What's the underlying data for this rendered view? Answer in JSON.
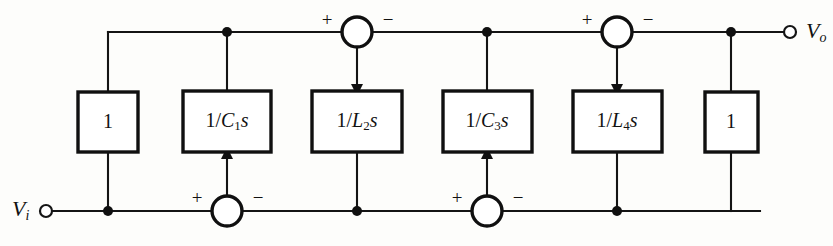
{
  "diagram": {
    "type": "signal-flow-block-diagram",
    "canvas": {
      "width": 833,
      "height": 246
    },
    "colors": {
      "line": "#141414",
      "block_stroke": "#101010",
      "background": "#fdfdfb",
      "text": "#111111"
    },
    "ports": [
      {
        "id": "input-port",
        "label_main": "V",
        "label_sub": "i",
        "x": 12,
        "y": 211,
        "terminal_x": 46,
        "terminal_y": 211,
        "terminal_r": 6
      },
      {
        "id": "output-port",
        "label_main": "V",
        "label_sub": "o",
        "x": 806,
        "y": 33,
        "terminal_x": 790,
        "terminal_y": 32,
        "terminal_r": 6
      }
    ],
    "blocks": [
      {
        "id": "block-1-left",
        "label_main": "1",
        "label_num": "1",
        "label_den": "",
        "label_sub": "",
        "label_tail": "",
        "x": 78,
        "y": 92,
        "w": 60,
        "h": 60,
        "cx": 108,
        "cy": 122
      },
      {
        "id": "block-c1s",
        "label_main": "1/C1s",
        "label_num": "1/",
        "label_den": "C",
        "label_sub": "1",
        "label_tail": "s",
        "x": 183,
        "y": 91,
        "w": 88,
        "h": 61,
        "cx": 227,
        "cy": 121
      },
      {
        "id": "block-l2s",
        "label_main": "1/L2s",
        "label_num": "1/",
        "label_den": "L",
        "label_sub": "2",
        "label_tail": "s",
        "x": 312,
        "y": 91,
        "w": 90,
        "h": 61,
        "cx": 357,
        "cy": 121
      },
      {
        "id": "block-c3s",
        "label_main": "1/C3s",
        "label_num": "1/",
        "label_den": "C",
        "label_sub": "3",
        "label_tail": "s",
        "x": 443,
        "y": 91,
        "w": 89,
        "h": 61,
        "cx": 487,
        "cy": 121
      },
      {
        "id": "block-l4s",
        "label_main": "1/L4s",
        "label_num": "1/",
        "label_den": "L",
        "label_sub": "4",
        "label_tail": "s",
        "x": 573,
        "y": 91,
        "w": 89,
        "h": 61,
        "cx": 617,
        "cy": 121
      },
      {
        "id": "block-1-right",
        "label_main": "1",
        "label_num": "1",
        "label_den": "",
        "label_sub": "",
        "label_tail": "",
        "x": 705,
        "y": 92,
        "w": 53,
        "h": 60,
        "cx": 731,
        "cy": 122
      }
    ],
    "summing_junctions": [
      {
        "id": "sum-top-left",
        "cx": 357,
        "cy": 32,
        "r": 15,
        "left_sign": "+",
        "right_sign": "−",
        "left_sign_x": 327,
        "right_sign_x": 388,
        "sign_y": 22,
        "output_direction": "down"
      },
      {
        "id": "sum-top-right",
        "cx": 617,
        "cy": 32,
        "r": 15,
        "left_sign": "+",
        "right_sign": "−",
        "left_sign_x": 587,
        "right_sign_x": 648,
        "sign_y": 22,
        "output_direction": "down"
      },
      {
        "id": "sum-bottom-left",
        "cx": 227,
        "cy": 211,
        "r": 15,
        "left_sign": "+",
        "right_sign": "−",
        "left_sign_x": 197,
        "right_sign_x": 258,
        "sign_y": 200,
        "output_direction": "up"
      },
      {
        "id": "sum-bottom-right",
        "cx": 487,
        "cy": 211,
        "r": 15,
        "left_sign": "+",
        "right_sign": "−",
        "left_sign_x": 457,
        "right_sign_x": 518,
        "sign_y": 200,
        "output_direction": "up"
      }
    ],
    "junction_dots": [
      {
        "id": "dot-top-c1s",
        "cx": 227,
        "cy": 32,
        "r": 5
      },
      {
        "id": "dot-top-c3s",
        "cx": 487,
        "cy": 32,
        "r": 5
      },
      {
        "id": "dot-top-output",
        "cx": 731,
        "cy": 32,
        "r": 5
      },
      {
        "id": "dot-bottom-input",
        "cx": 108,
        "cy": 211,
        "r": 5
      },
      {
        "id": "dot-bottom-l2s",
        "cx": 357,
        "cy": 211,
        "r": 5
      },
      {
        "id": "dot-bottom-l4s",
        "cx": 617,
        "cy": 211,
        "r": 5
      }
    ],
    "wires": [
      {
        "id": "wire-top-main",
        "d": "M 108 32 L 342 32"
      },
      {
        "id": "wire-top-seg2",
        "d": "M 372 32 L 602 32"
      },
      {
        "id": "wire-top-seg3",
        "d": "M 632 32 L 790 32"
      },
      {
        "id": "wire-top-down-block1",
        "d": "M 108 32 L 108 92"
      },
      {
        "id": "wire-top-down-c1s",
        "d": "M 227 32 L 227 91"
      },
      {
        "id": "wire-top-down-c3s",
        "d": "M 487 32 L 487 91"
      },
      {
        "id": "wire-top-down-block1r",
        "d": "M 731 32 L 731 92"
      },
      {
        "id": "wire-sum-tl-to-l2s",
        "d": "M 357 47 L 357 85"
      },
      {
        "id": "wire-sum-tr-to-l4s",
        "d": "M 617 47 L 617 85"
      },
      {
        "id": "wire-bottom-main",
        "d": "M 46 211 L 212 211"
      },
      {
        "id": "wire-bottom-seg2",
        "d": "M 242 211 L 472 211"
      },
      {
        "id": "wire-bottom-seg3",
        "d": "M 502 211 L 760 211"
      },
      {
        "id": "wire-bottom-up-block1",
        "d": "M 108 211 L 108 152"
      },
      {
        "id": "wire-bottom-up-l2s",
        "d": "M 357 211 L 357 152"
      },
      {
        "id": "wire-bottom-up-l4s",
        "d": "M 617 211 L 617 152"
      },
      {
        "id": "wire-bottom-up-block1r",
        "d": "M 731 211 L 731 152"
      },
      {
        "id": "wire-sum-bl-to-c1s",
        "d": "M 227 196 L 227 158"
      },
      {
        "id": "wire-sum-br-to-c3s",
        "d": "M 487 196 L 487 158"
      }
    ],
    "arrowheads": [
      {
        "id": "arrow-into-l2s",
        "points": "351,84 363,84 357,96",
        "direction": "down"
      },
      {
        "id": "arrow-into-l4s",
        "points": "611,84 623,84 617,96",
        "direction": "down"
      },
      {
        "id": "arrow-into-c1s",
        "points": "221,159 233,159 227,147",
        "direction": "up"
      },
      {
        "id": "arrow-into-c3s",
        "points": "481,159 493,159 487,147",
        "direction": "up"
      }
    ]
  }
}
